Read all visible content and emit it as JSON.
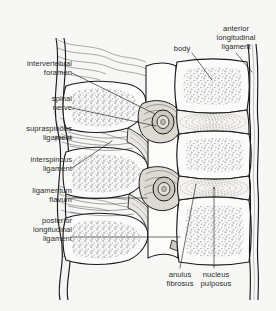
{
  "figure": {
    "name": "lumbar-spine-sagittal-section",
    "background_color": "#f7f7f6",
    "line_color": "#1a1a1a",
    "text_color": "#2b2b2b",
    "bone_fill": "#fbfbfa",
    "disc_fill": "#f4f3f1",
    "ligament_fill": "#e8e6e2",
    "nerve_fill": "#d8d5d0",
    "stipple_color": "#6d6d6d"
  },
  "labels": {
    "intervertebral_foramen": {
      "line1": "intervertebral",
      "line2": "foramen"
    },
    "spinal_nerve": {
      "line1": "spinal",
      "line2": "nerve"
    },
    "supraspinous_ligament": {
      "line1": "supraspinous",
      "line2": "ligament"
    },
    "interspinous_ligament": {
      "line1": "interspinous",
      "line2": "ligament"
    },
    "ligamentum_flavum": {
      "line1": "ligamentum",
      "line2": "flavum"
    },
    "posterior_longitudinal_ligament": {
      "line1": "posterior",
      "line2": "longitudinal",
      "line3": "ligament"
    },
    "body": {
      "line1": "body"
    },
    "anterior_longitudinal_ligament": {
      "line1": "anterior",
      "line2": "longitudinal",
      "line3": "ligament"
    },
    "anulus_fibrosus": {
      "line1": "anulus",
      "line2": "fibrosus"
    },
    "nucleus_pulposus": {
      "line1": "nucleus",
      "line2": "pulposus"
    }
  },
  "structures": [
    {
      "name": "vertebral-body",
      "count": 3,
      "description": "cancellous bone with stippling"
    },
    {
      "name": "intervertebral-disc",
      "count": 3,
      "description": "concentric lamellae of anulus fibrosus around nucleus pulposus"
    },
    {
      "name": "spinous-process",
      "count": 3,
      "description": "posterior projection with cancellous stippling"
    },
    {
      "name": "spinal-nerve",
      "count": 2,
      "description": "oval nerve root in intervertebral foramen"
    },
    {
      "name": "anterior-longitudinal-ligament",
      "count": 1,
      "description": "vertical band along anterior vertebral bodies"
    },
    {
      "name": "posterior-longitudinal-ligament",
      "count": 1,
      "description": "band along posterior vertebral bodies"
    },
    {
      "name": "ligamentum-flavum",
      "count": 2,
      "description": "band between laminae"
    },
    {
      "name": "supraspinous-ligament",
      "count": 1,
      "description": "band along spinous process tips"
    },
    {
      "name": "interspinous-ligament",
      "count": 2,
      "description": "fibers between spinous processes"
    }
  ]
}
